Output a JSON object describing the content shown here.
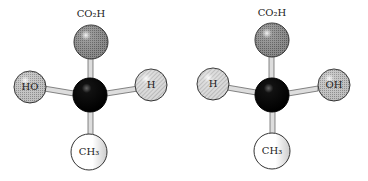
{
  "figure": {
    "molecules": [
      {
        "top_label": "CO₂H",
        "left_label": "HO",
        "right_label": "H",
        "bottom_label": "CH₃"
      },
      {
        "top_label": "CO₂H",
        "left_label": "H",
        "right_label": "OH",
        "bottom_label": "CH₃"
      }
    ]
  }
}
